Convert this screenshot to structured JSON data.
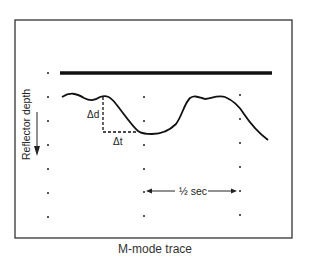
{
  "diagram": {
    "caption": "M-mode trace",
    "y_axis_label": "Reflector depth",
    "delta_depth_label": "Δd",
    "delta_time_label": "Δt",
    "time_scale_label": "½ sec",
    "colors": {
      "line": "#111111",
      "frame": "#222222",
      "background": "#ffffff"
    }
  }
}
